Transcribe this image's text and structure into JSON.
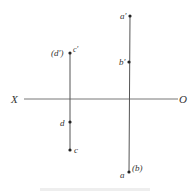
{
  "diagram": {
    "axis": {
      "left_label": "X",
      "right_label": "O"
    },
    "points": {
      "c_prime": "c′",
      "d_prime": "(d′)",
      "d": "d",
      "c": "c",
      "a_prime": "a′",
      "b_prime": "b′",
      "a": "a",
      "b": "(b)"
    },
    "colors": {
      "line": "#666666",
      "point": "#222222",
      "text": "#333333"
    }
  }
}
